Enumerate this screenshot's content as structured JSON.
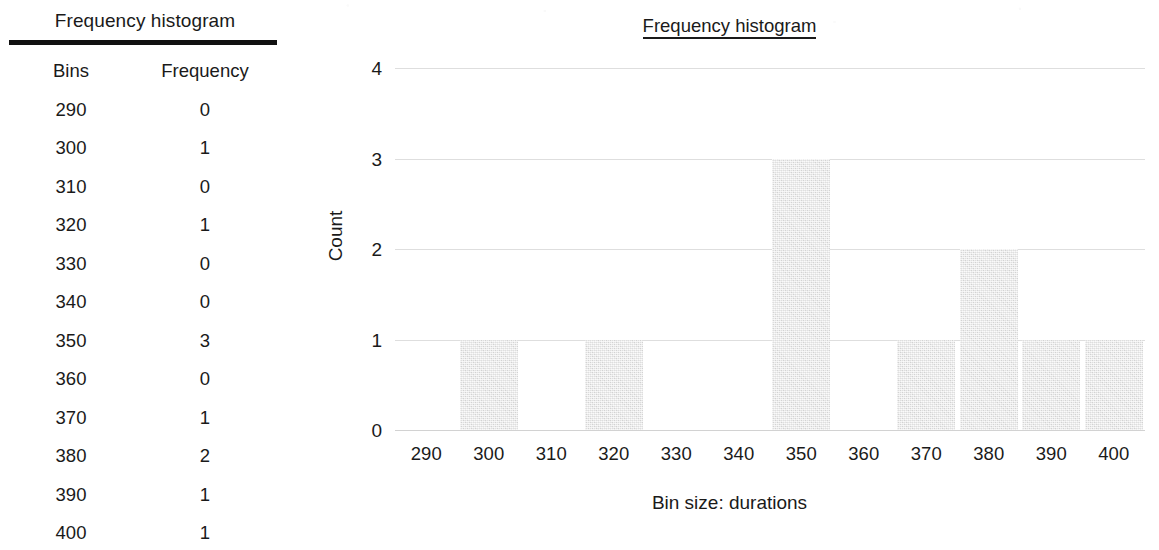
{
  "table": {
    "title": "Frequency histogram",
    "columns": [
      "Bins",
      "Frequency"
    ],
    "rows": [
      [
        "290",
        "0"
      ],
      [
        "300",
        "1"
      ],
      [
        "310",
        "0"
      ],
      [
        "320",
        "1"
      ],
      [
        "330",
        "0"
      ],
      [
        "340",
        "0"
      ],
      [
        "350",
        "3"
      ],
      [
        "360",
        "0"
      ],
      [
        "370",
        "1"
      ],
      [
        "380",
        "2"
      ],
      [
        "390",
        "1"
      ],
      [
        "400",
        "1"
      ]
    ]
  },
  "chart_data": {
    "type": "bar",
    "title": "Frequency histogram",
    "xlabel": "Bin size: durations",
    "ylabel": "Count",
    "categories": [
      "290",
      "300",
      "310",
      "320",
      "330",
      "340",
      "350",
      "360",
      "370",
      "380",
      "390",
      "400"
    ],
    "values": [
      0,
      1,
      0,
      1,
      0,
      0,
      3,
      0,
      1,
      2,
      1,
      1
    ],
    "ylim": [
      0,
      4
    ],
    "yticks": [
      "0",
      "1",
      "2",
      "3",
      "4"
    ],
    "grid": "horizontal",
    "legend": "none",
    "bar_color": "#e2e2e2",
    "grid_color": "#dedede",
    "text_color": "#1a1a1a"
  }
}
